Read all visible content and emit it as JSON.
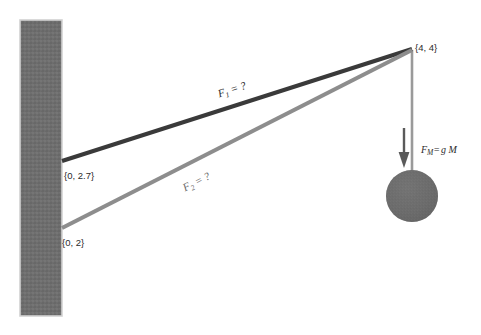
{
  "diagram": {
    "canvas": {
      "width": 481,
      "height": 335,
      "background": "#ffffff"
    },
    "wall": {
      "name": "vertical-wall",
      "color": "#6e6e6e",
      "edge_color": "#cfcfcf",
      "x": 20,
      "y": 20,
      "width": 42,
      "height": 296
    },
    "anchor_point": {
      "label": "{4, 4}",
      "x": 412,
      "y": 47
    },
    "cables": [
      {
        "id": "F1",
        "label": "F",
        "subscript": "1",
        "equals": " = ?",
        "full_label": "F1 = ?",
        "color": "#3a3a3a",
        "width": 4.2,
        "wall_point_label": "{0, 2.7}",
        "x1": 62,
        "y1": 161,
        "x2": 412,
        "y2": 49,
        "label_x": 233,
        "label_y": 93,
        "label_rotation": -17.7
      },
      {
        "id": "F2",
        "label": "F",
        "subscript": "2",
        "equals": " = ?",
        "full_label": "F2 = ?",
        "color": "#8d8d8d",
        "width": 4.2,
        "wall_point_label": "{0, 2}",
        "x1": 62,
        "y1": 228,
        "x2": 412,
        "y2": 50,
        "label_x": 198,
        "label_y": 185,
        "label_rotation": -26.9
      }
    ],
    "rope": {
      "name": "vertical-rope",
      "color": "#9a9a9a",
      "width": 2.6,
      "x": 412,
      "y1": 50,
      "y2": 196
    },
    "mass": {
      "name": "hanging-mass-ball",
      "color": "#6b6b6b",
      "cx": 412,
      "cy": 196,
      "r": 26
    },
    "weight_arrow": {
      "name": "weight-force-arrow",
      "color": "#5a5a5a",
      "x": 404,
      "y_start": 128,
      "y_end": 166,
      "label": "F",
      "subscript": "M",
      "equals": "=",
      "expression": "g M",
      "full_label": "FM= g M",
      "label_x": 421,
      "label_y": 153
    },
    "coordinate_labels": [
      {
        "text": "{0, 2.7}",
        "x": 64,
        "y": 179
      },
      {
        "text": "{0, 2}",
        "x": 62,
        "y": 246
      },
      {
        "text": "{4, 4}",
        "x": 415,
        "y": 51
      }
    ],
    "colors": {
      "wall": "#6e6e6e",
      "cable_primary": "#3a3a3a",
      "cable_secondary": "#8d8d8d",
      "mass": "#6b6b6b",
      "rope": "#9a9a9a",
      "arrow": "#5a5a5a",
      "text": "#2b2b2b",
      "background": "#ffffff"
    }
  }
}
